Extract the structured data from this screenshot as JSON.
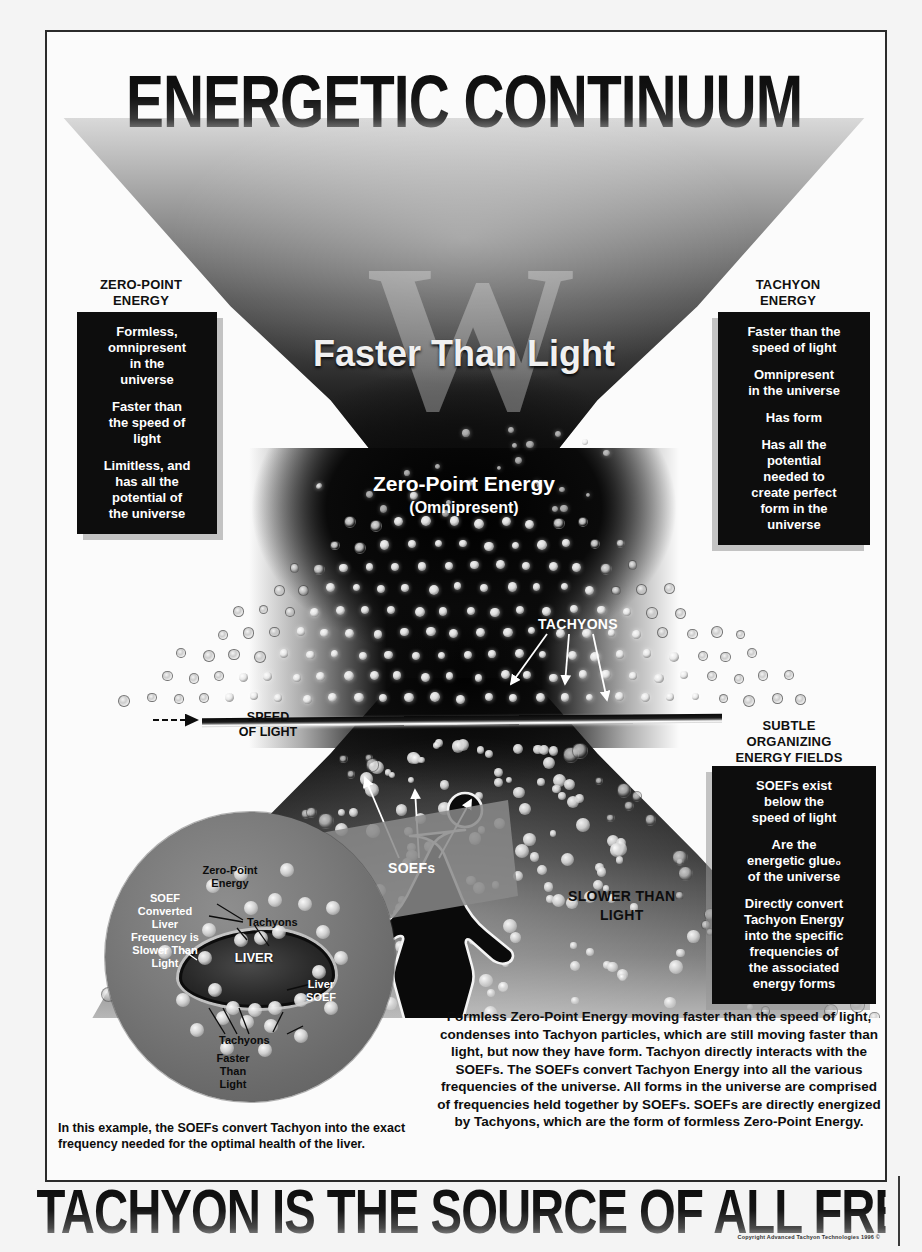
{
  "poster": {
    "title": "ENERGETIC CONTINUUM",
    "banner": "TACHYON IS THE SOURCE OF ALL FREQUENCIES",
    "copyright": "Copyright Advanced Tachyon Technologies 1996 ©",
    "watermark": "W"
  },
  "diagram_labels": {
    "faster_than_light": "Faster Than Light",
    "zero_point_center_line1": "Zero-Point Energy",
    "zero_point_center_line2": "(Omnipresent)",
    "tachyons": "TACHYONS",
    "speed_of_light_line1": "SPEED",
    "speed_of_light_line2": "OF LIGHT",
    "soefs": "SOEFs",
    "slower_than_light_line1": "SLOWER THAN",
    "slower_than_light_line2": "LIGHT"
  },
  "magnifier": {
    "zero_point_energy_line1": "Zero-Point",
    "zero_point_energy_line2": "Energy",
    "soef_converted": "SOEF\nConverted\nLiver\nFrequency is\nSlower Than\nLight",
    "tachyons_upper": "Tachyons",
    "tachyons_lower": "Tachyons",
    "liver": "LIVER",
    "liver_soef_line1": "Liver",
    "liver_soef_line2": "SOEF",
    "faster_than_light_line1": "Faster",
    "faster_than_light_line2": "Than",
    "faster_than_light_line3": "Light"
  },
  "callouts": [
    {
      "id": "zero-point-energy",
      "heading": "ZERO-POINT\nENERGY",
      "items": [
        "Formless,\nomnipresent\nin the\nuniverse",
        "Faster than\nthe speed of\nlight",
        "Limitless, and\nhas all the\npotential of\nthe universe"
      ]
    },
    {
      "id": "tachyon-energy",
      "heading": "TACHYON\nENERGY",
      "items": [
        "Faster than the\nspeed of light",
        "Omnipresent\nin the universe",
        "Has form",
        "Has all the\npotential\nneeded to\ncreate perfect\nform in the\nuniverse"
      ]
    },
    {
      "id": "subtle-organizing-energy-fields",
      "heading": "SUBTLE\nORGANIZING\nENERGY FIELDS",
      "items": [
        "SOEFs exist\nbelow the\nspeed of light",
        "Are the\nenergetic glue₀\nof the universe",
        "Directly convert\nTachyon Energy\ninto the specific\nfrequencies of\nthe associated\nenergy forms"
      ]
    }
  ],
  "paragraphs": {
    "right": "Formless Zero-Point Energy moving faster than the speed of light, condenses into Tachyon particles, which are still moving faster than light, but now they have form. Tachyon directly interacts with the SOEFs. The SOEFs convert Tachyon Energy into all the various frequencies of the universe. All forms in the universe are comprised of frequencies held together by SOEFs. SOEFs are directly energized by Tachyons, which are the form of formless Zero-Point Energy.",
    "left": "In this example, the SOEFs convert Tachyon into the exact frequency needed for the optimal health of the liver."
  },
  "colors": {
    "ink": "#0d0d0d",
    "box_bg": "#0d0d0d",
    "box_text": "#ffffff",
    "paper": "#fbfbfb",
    "field_dark": "#050505"
  }
}
